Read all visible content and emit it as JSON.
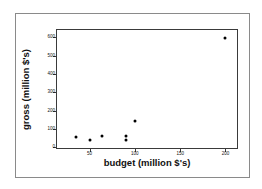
{
  "chart_data": {
    "type": "scatter",
    "title": "",
    "xlabel": "budget (million $'s)",
    "ylabel": "gross (million $'s)",
    "xlim": [
      14,
      215
    ],
    "ylim": [
      -15,
      640
    ],
    "xticks": [
      50,
      100,
      150,
      200
    ],
    "xtick_labels": [
      "50",
      "100",
      "150",
      "200"
    ],
    "yticks": [
      0,
      100,
      200,
      300,
      400,
      500,
      600
    ],
    "ytick_labels": [
      "0",
      "100",
      "200",
      "300",
      "400",
      "500",
      "600"
    ],
    "grid": false,
    "legend": null,
    "marker": "filled-circle",
    "marker_color": "#000000",
    "points": [
      {
        "x": 35,
        "y": 55
      },
      {
        "x": 50,
        "y": 42
      },
      {
        "x": 64,
        "y": 62
      },
      {
        "x": 90,
        "y": 42
      },
      {
        "x": 90,
        "y": 62
      },
      {
        "x": 100,
        "y": 145
      },
      {
        "x": 200,
        "y": 595
      }
    ],
    "series": [
      {
        "name": "movies",
        "x": [
          35,
          50,
          64,
          90,
          90,
          100,
          200
        ],
        "values": [
          55,
          42,
          62,
          42,
          62,
          145,
          595
        ]
      }
    ]
  },
  "figure": {
    "frame_color": "#3a3a3a",
    "border_color": "#8a8a8a",
    "background": "#ffffff"
  }
}
